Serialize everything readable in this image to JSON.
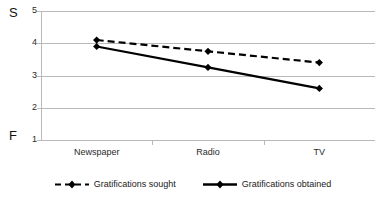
{
  "chart_data": {
    "type": "line",
    "title": "",
    "subtitle": "",
    "xlabel": "",
    "ylabel": "",
    "categories": [
      "Newspaper",
      "Radio",
      "TV"
    ],
    "series": [
      {
        "name": "Gratifications sought",
        "values": [
          4.1,
          3.75,
          3.4
        ],
        "style": "dashed",
        "marker": "diamond",
        "color": "#000000"
      },
      {
        "name": "Gratifications obtained",
        "values": [
          3.9,
          3.25,
          2.6
        ],
        "style": "solid",
        "marker": "diamond",
        "color": "#000000"
      }
    ],
    "ylim": [
      1,
      5
    ],
    "yticks": [
      "1",
      "2",
      "3",
      "4",
      "5"
    ],
    "grid": true,
    "legend_position": "bottom"
  },
  "axis_annotations": {
    "top_label": "S",
    "bottom_label": "F"
  },
  "legend": {
    "items": [
      {
        "label": "Gratifications sought"
      },
      {
        "label": "Gratifications obtained"
      }
    ]
  },
  "colors": {
    "line": "#000000",
    "grid": "#b9b9b9",
    "text": "#1a1a1a",
    "background": "#ffffff"
  }
}
